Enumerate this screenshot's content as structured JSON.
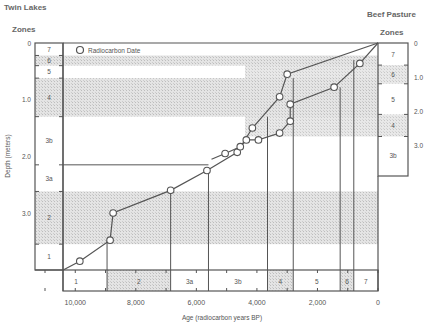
{
  "chart_data": {
    "type": "line",
    "title_left": "Twin Lakes",
    "title_right": "Beef Pasture",
    "zones_label_left": "Zones",
    "zones_label_right": "Zones",
    "legend": [
      {
        "marker": "open-circle",
        "label": "Radiocarbon Date"
      }
    ],
    "xlabel": "Age (radiocarbon years BP)",
    "ylabel_left": "Depth (meters)",
    "x_ticks": [
      "10,000",
      "8,000",
      "6,000",
      "4,000",
      "2,000",
      "0"
    ],
    "x_tick_values": [
      10000,
      8000,
      6000,
      4000,
      2000,
      0
    ],
    "xlim": [
      11000,
      0
    ],
    "y_left_ticks": [
      "0",
      "1.0",
      "2.0",
      "3.0"
    ],
    "y_left_lim": [
      0,
      4.0
    ],
    "y_right_ticks": [
      "0",
      "1.0",
      "2.0",
      "3.0"
    ],
    "y_right_lim": [
      0,
      3.9
    ],
    "left_zones": [
      {
        "label": "7",
        "top": 0.0,
        "bottom": 0.22,
        "shaded": false
      },
      {
        "label": "6",
        "top": 0.22,
        "bottom": 0.4,
        "shaded": true
      },
      {
        "label": "5",
        "top": 0.4,
        "bottom": 0.62,
        "shaded": false
      },
      {
        "label": "4",
        "top": 0.62,
        "bottom": 1.3,
        "shaded": true
      },
      {
        "label": "3b",
        "top": 1.3,
        "bottom": 2.15,
        "shaded": false
      },
      {
        "label": "3a",
        "top": 2.15,
        "bottom": 2.62,
        "shaded": false
      },
      {
        "label": "2",
        "top": 2.62,
        "bottom": 3.55,
        "shaded": true
      },
      {
        "label": "1",
        "top": 3.55,
        "bottom": 4.0,
        "shaded": false
      }
    ],
    "right_zones": [
      {
        "label": "7",
        "top": 0.0,
        "bottom": 0.65,
        "shaded": false
      },
      {
        "label": "6",
        "top": 0.65,
        "bottom": 1.2,
        "shaded": true
      },
      {
        "label": "5",
        "top": 1.2,
        "bottom": 2.1,
        "shaded": false
      },
      {
        "label": "4",
        "top": 2.1,
        "bottom": 2.75,
        "shaded": true
      },
      {
        "label": "3b",
        "top": 2.75,
        "bottom": 3.85,
        "shaded": false
      }
    ],
    "age_zones": [
      {
        "label": "1",
        "from": 11000,
        "to": 8950,
        "shaded": false
      },
      {
        "label": "2",
        "from": 8950,
        "to": 6850,
        "shaded": true
      },
      {
        "label": "3a",
        "from": 6850,
        "to": 5600,
        "shaded": false
      },
      {
        "label": "3b",
        "from": 5600,
        "to": 3650,
        "shaded": false
      },
      {
        "label": "4",
        "from": 3650,
        "to": 2800,
        "shaded": true
      },
      {
        "label": "5",
        "from": 2800,
        "to": 1250,
        "shaded": false
      },
      {
        "label": "6",
        "from": 1250,
        "to": 800,
        "shaded": true
      },
      {
        "label": "7",
        "from": 800,
        "to": 0,
        "shaded": false
      }
    ],
    "series": [
      {
        "name": "Twin Lakes",
        "axis": "left",
        "dates": [
          {
            "age": 9850,
            "depth": 3.85
          },
          {
            "age": 8850,
            "depth": 3.48
          },
          {
            "age": 8750,
            "depth": 3.0
          },
          {
            "age": 6850,
            "depth": 2.6
          },
          {
            "age": 5650,
            "depth": 2.25
          },
          {
            "age": 4650,
            "depth": 1.93
          },
          {
            "age": 4150,
            "depth": 1.5
          },
          {
            "age": 3250,
            "depth": 0.95
          },
          {
            "age": 3000,
            "depth": 0.55
          }
        ]
      },
      {
        "name": "Beef Pasture",
        "axis": "right",
        "dates": [
          {
            "age": 5050,
            "depth": 3.25
          },
          {
            "age": 4550,
            "depth": 3.05
          },
          {
            "age": 4350,
            "depth": 2.85
          },
          {
            "age": 3950,
            "depth": 2.85
          },
          {
            "age": 3250,
            "depth": 2.65
          },
          {
            "age": 2900,
            "depth": 2.3
          },
          {
            "age": 2900,
            "depth": 1.8
          },
          {
            "age": 1450,
            "depth": 1.3
          },
          {
            "age": 600,
            "depth": 0.6
          }
        ]
      }
    ]
  }
}
